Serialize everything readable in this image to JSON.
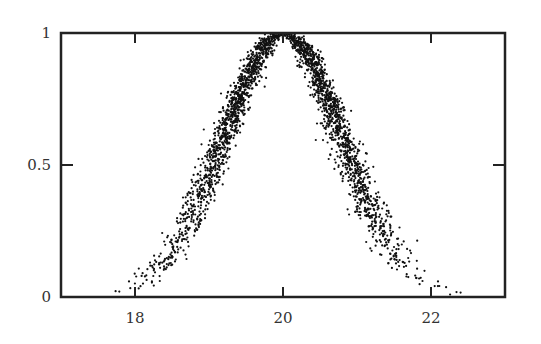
{
  "chart_data": {
    "type": "scatter",
    "title": "",
    "xlabel": "",
    "ylabel": "",
    "xlim": [
      17,
      23
    ],
    "ylim": [
      0,
      1
    ],
    "grid": false,
    "legend": null,
    "x_ticks": [
      18,
      20,
      22
    ],
    "x_tick_labels": [
      "18",
      "20",
      "22"
    ],
    "y_ticks": [
      0,
      0.5,
      1
    ],
    "y_tick_labels": [
      "0",
      "0.5",
      "1"
    ],
    "series": [
      {
        "name": "noisy gaussian samples",
        "model": {
          "shape": "gaussian",
          "center": 20,
          "sigma": 0.8,
          "amplitude": 1,
          "x_noise_sd": 0.07,
          "n_points": 2600,
          "x_range": [
            17.4,
            22.5
          ]
        },
        "color": "#111111",
        "sample_points": [
          {
            "x": 17.5,
            "y": 0.01
          },
          {
            "x": 18.0,
            "y": 0.04
          },
          {
            "x": 18.5,
            "y": 0.17
          },
          {
            "x": 19.0,
            "y": 0.46
          },
          {
            "x": 19.5,
            "y": 0.82
          },
          {
            "x": 20.0,
            "y": 1.0
          },
          {
            "x": 20.5,
            "y": 0.82
          },
          {
            "x": 21.0,
            "y": 0.46
          },
          {
            "x": 21.5,
            "y": 0.17
          },
          {
            "x": 22.0,
            "y": 0.04
          },
          {
            "x": 22.4,
            "y": 0.01
          }
        ]
      }
    ]
  },
  "colors": {
    "frame": "#222222",
    "points": "#111111",
    "background": "#ffffff"
  },
  "layout": {
    "plot_left": 61,
    "plot_right": 505,
    "plot_top": 33,
    "plot_bottom": 297
  }
}
